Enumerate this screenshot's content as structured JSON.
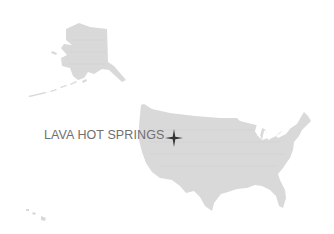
{
  "map": {
    "regions": [
      "Alaska",
      "Contiguous United States",
      "Hawaii"
    ],
    "land_color": "#d9d9d9",
    "marker": {
      "label": "LAVA HOT SPRINGS",
      "icon": "four-point-star-icon",
      "label_color": "#707070",
      "marker_color": "#333333"
    }
  }
}
